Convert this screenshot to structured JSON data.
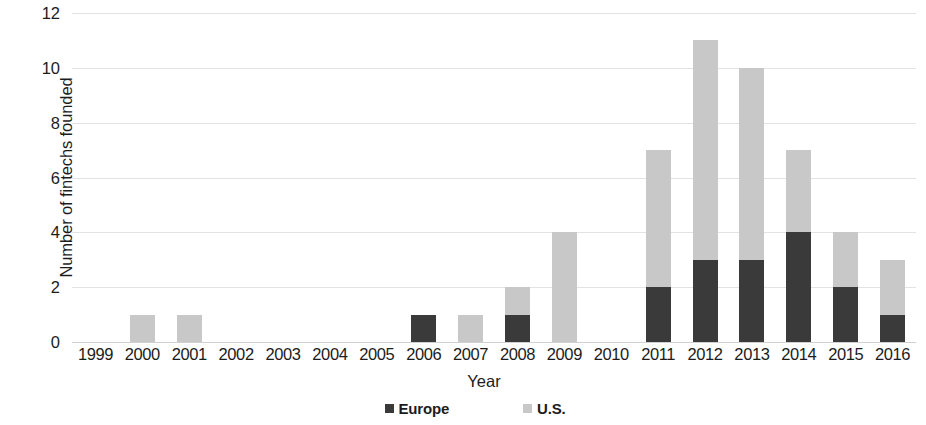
{
  "chart_data": {
    "type": "bar",
    "subtype": "stacked-column",
    "title": "",
    "xlabel": "Year",
    "ylabel": "Number of fintechs founded",
    "ylim": [
      0,
      12
    ],
    "ytick_step": 2,
    "yticks": [
      12,
      10,
      8,
      6,
      4,
      2,
      0
    ],
    "grid": true,
    "legend_position": "bottom",
    "categories": [
      "1999",
      "2000",
      "2001",
      "2002",
      "2003",
      "2004",
      "2005",
      "2006",
      "2007",
      "2008",
      "2009",
      "2010",
      "2011",
      "2012",
      "2013",
      "2014",
      "2015",
      "2016"
    ],
    "series": [
      {
        "name": "Europe",
        "color": "#3a3a3a",
        "values": [
          0,
          0,
          0,
          0,
          0,
          0,
          0,
          1,
          0,
          1,
          0,
          0,
          2,
          3,
          3,
          4,
          2,
          1
        ]
      },
      {
        "name": "U.S.",
        "color": "#c8c8c8",
        "values": [
          0,
          1,
          1,
          0,
          0,
          0,
          0,
          0,
          1,
          1,
          4,
          0,
          5,
          8,
          7,
          3,
          2,
          2
        ]
      }
    ],
    "totals": [
      0,
      1,
      1,
      0,
      0,
      0,
      0,
      1,
      1,
      2,
      4,
      0,
      7,
      11,
      10,
      7,
      4,
      3
    ]
  },
  "legend": {
    "items": [
      {
        "label": "Europe",
        "color": "#3a3a3a"
      },
      {
        "label": "U.S.",
        "color": "#c8c8c8"
      }
    ]
  }
}
